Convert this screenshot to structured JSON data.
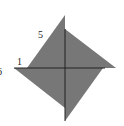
{
  "diagram": {
    "fill_color": "#777777",
    "line_color": "#222222",
    "labels": [
      {
        "id": "label-5",
        "text": "5",
        "x": 38,
        "y": 30
      },
      {
        "id": "label-1",
        "text": "1",
        "x": 17,
        "y": 57
      },
      {
        "id": "label-6",
        "text": "6",
        "x": -3,
        "y": 67
      }
    ],
    "triangles": [
      {
        "name": "upper-left",
        "points": "65,15 27,68 65,68"
      },
      {
        "name": "upper-right",
        "points": "65,29 116,68 65,68"
      },
      {
        "name": "lower-left",
        "points": "14,68 65,68 65,108"
      },
      {
        "name": "lower-right",
        "points": "103,68 65,121 65,68"
      }
    ],
    "axes": [
      {
        "name": "horizontal-axis",
        "x1": 14,
        "y1": 68,
        "x2": 105,
        "y2": 68
      },
      {
        "name": "vertical-axis",
        "x1": 65,
        "y1": 29,
        "x2": 65,
        "y2": 121
      }
    ]
  }
}
